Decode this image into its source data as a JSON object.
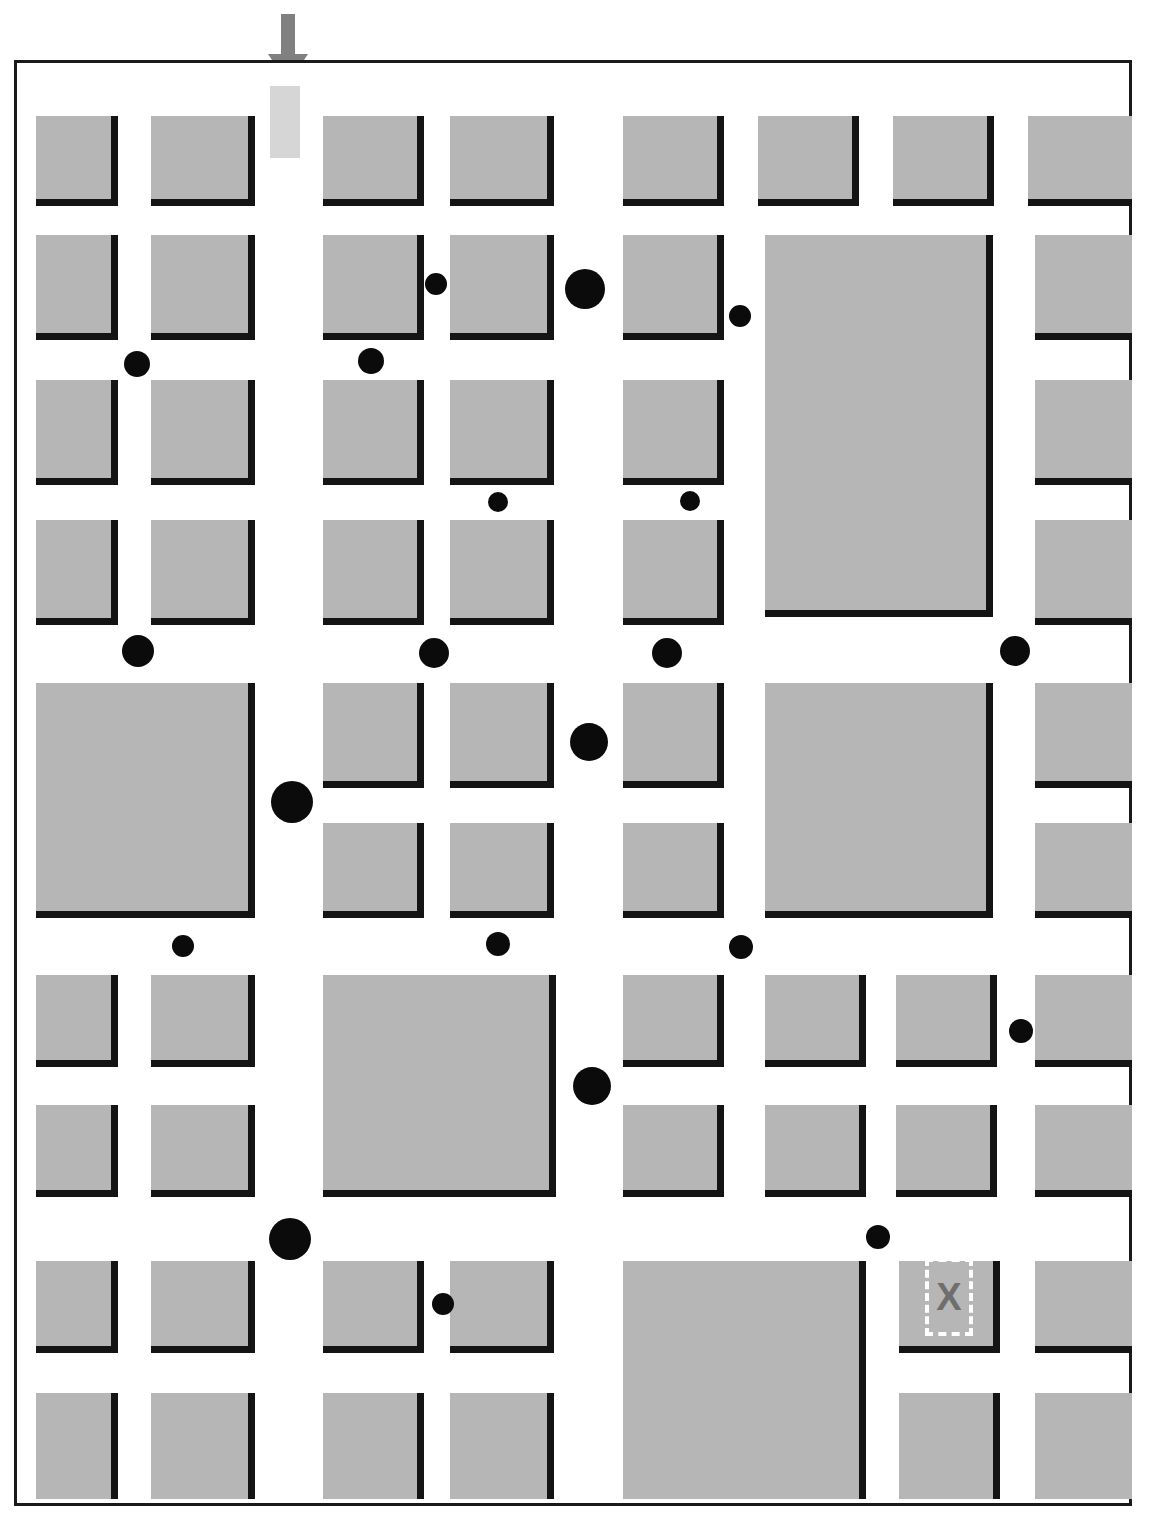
{
  "figure": {
    "type": "map-diagram",
    "kind": "urban-block-plan",
    "clipped_title": "",
    "frame": {
      "x": 14,
      "y": 60,
      "width": 1118,
      "height": 1446,
      "stroke": "#1a1a1a",
      "stroke_width": 3
    },
    "palette": {
      "background": "#ffffff",
      "block_fill": "#b6b6b6",
      "block_shadow": "#141414",
      "dot": "#0b0b0b",
      "arrow": "#808080",
      "arrow_highlight": "#d6d6d6",
      "dest_x": "#6e6e6e",
      "dest_outline": "#ffffff"
    }
  },
  "entry_arrow": {
    "label": "entry-arrow",
    "color": "#808080",
    "x": 266,
    "y": 14,
    "width": 44,
    "height": 72,
    "direction": "down"
  },
  "entry_highlight": {
    "label": "entry-corridor-highlight",
    "color": "#d6d6d6",
    "x": 270,
    "y": 86,
    "width": 30,
    "height": 72
  },
  "destination": {
    "label": "X",
    "marker_style": "dashed-white-rectangle",
    "x": 925,
    "y": 1258,
    "width": 48,
    "height": 78
  },
  "blocks": [
    {
      "x": 33,
      "y": 113,
      "w": 82,
      "h": 90,
      "clip": ""
    },
    {
      "x": 148,
      "y": 113,
      "w": 104,
      "h": 90,
      "clip": ""
    },
    {
      "x": 320,
      "y": 113,
      "w": 101,
      "h": 90,
      "clip": ""
    },
    {
      "x": 447,
      "y": 113,
      "w": 104,
      "h": 90,
      "clip": ""
    },
    {
      "x": 620,
      "y": 113,
      "w": 101,
      "h": 90,
      "clip": ""
    },
    {
      "x": 755,
      "y": 113,
      "w": 101,
      "h": 90,
      "clip": ""
    },
    {
      "x": 890,
      "y": 113,
      "w": 101,
      "h": 90,
      "clip": ""
    },
    {
      "x": 1025,
      "y": 113,
      "w": 104,
      "h": 90,
      "clip": "r"
    },
    {
      "x": 33,
      "y": 232,
      "w": 82,
      "h": 105,
      "clip": ""
    },
    {
      "x": 148,
      "y": 232,
      "w": 104,
      "h": 105,
      "clip": ""
    },
    {
      "x": 320,
      "y": 232,
      "w": 101,
      "h": 105,
      "clip": ""
    },
    {
      "x": 447,
      "y": 232,
      "w": 104,
      "h": 105,
      "clip": ""
    },
    {
      "x": 620,
      "y": 232,
      "w": 101,
      "h": 105,
      "clip": ""
    },
    {
      "x": 762,
      "y": 232,
      "w": 228,
      "h": 382,
      "clip": ""
    },
    {
      "x": 1032,
      "y": 232,
      "w": 97,
      "h": 105,
      "clip": "r"
    },
    {
      "x": 33,
      "y": 377,
      "w": 82,
      "h": 105,
      "clip": ""
    },
    {
      "x": 148,
      "y": 377,
      "w": 104,
      "h": 105,
      "clip": ""
    },
    {
      "x": 320,
      "y": 377,
      "w": 101,
      "h": 105,
      "clip": ""
    },
    {
      "x": 447,
      "y": 377,
      "w": 104,
      "h": 105,
      "clip": ""
    },
    {
      "x": 620,
      "y": 377,
      "w": 101,
      "h": 105,
      "clip": ""
    },
    {
      "x": 1032,
      "y": 377,
      "w": 97,
      "h": 105,
      "clip": "r"
    },
    {
      "x": 33,
      "y": 517,
      "w": 82,
      "h": 105,
      "clip": ""
    },
    {
      "x": 148,
      "y": 517,
      "w": 104,
      "h": 105,
      "clip": ""
    },
    {
      "x": 320,
      "y": 517,
      "w": 101,
      "h": 105,
      "clip": ""
    },
    {
      "x": 447,
      "y": 517,
      "w": 104,
      "h": 105,
      "clip": ""
    },
    {
      "x": 620,
      "y": 517,
      "w": 101,
      "h": 105,
      "clip": ""
    },
    {
      "x": 1032,
      "y": 517,
      "w": 97,
      "h": 105,
      "clip": "r"
    },
    {
      "x": 33,
      "y": 680,
      "w": 219,
      "h": 235,
      "clip": ""
    },
    {
      "x": 320,
      "y": 680,
      "w": 101,
      "h": 105,
      "clip": ""
    },
    {
      "x": 447,
      "y": 680,
      "w": 104,
      "h": 105,
      "clip": ""
    },
    {
      "x": 620,
      "y": 680,
      "w": 101,
      "h": 105,
      "clip": ""
    },
    {
      "x": 762,
      "y": 680,
      "w": 228,
      "h": 235,
      "clip": ""
    },
    {
      "x": 1032,
      "y": 680,
      "w": 97,
      "h": 105,
      "clip": "r"
    },
    {
      "x": 320,
      "y": 820,
      "w": 101,
      "h": 95,
      "clip": ""
    },
    {
      "x": 447,
      "y": 820,
      "w": 104,
      "h": 95,
      "clip": ""
    },
    {
      "x": 620,
      "y": 820,
      "w": 101,
      "h": 95,
      "clip": ""
    },
    {
      "x": 1032,
      "y": 820,
      "w": 97,
      "h": 95,
      "clip": "r"
    },
    {
      "x": 33,
      "y": 972,
      "w": 82,
      "h": 92,
      "clip": ""
    },
    {
      "x": 148,
      "y": 972,
      "w": 104,
      "h": 92,
      "clip": ""
    },
    {
      "x": 320,
      "y": 972,
      "w": 233,
      "h": 222,
      "clip": ""
    },
    {
      "x": 620,
      "y": 972,
      "w": 101,
      "h": 92,
      "clip": ""
    },
    {
      "x": 762,
      "y": 972,
      "w": 101,
      "h": 92,
      "clip": ""
    },
    {
      "x": 893,
      "y": 972,
      "w": 101,
      "h": 92,
      "clip": ""
    },
    {
      "x": 1032,
      "y": 972,
      "w": 97,
      "h": 92,
      "clip": "r"
    },
    {
      "x": 33,
      "y": 1102,
      "w": 82,
      "h": 92,
      "clip": ""
    },
    {
      "x": 148,
      "y": 1102,
      "w": 104,
      "h": 92,
      "clip": ""
    },
    {
      "x": 620,
      "y": 1102,
      "w": 101,
      "h": 92,
      "clip": ""
    },
    {
      "x": 762,
      "y": 1102,
      "w": 101,
      "h": 92,
      "clip": ""
    },
    {
      "x": 893,
      "y": 1102,
      "w": 101,
      "h": 92,
      "clip": ""
    },
    {
      "x": 1032,
      "y": 1102,
      "w": 97,
      "h": 92,
      "clip": "r"
    },
    {
      "x": 33,
      "y": 1258,
      "w": 82,
      "h": 92,
      "clip": ""
    },
    {
      "x": 148,
      "y": 1258,
      "w": 104,
      "h": 92,
      "clip": ""
    },
    {
      "x": 320,
      "y": 1258,
      "w": 101,
      "h": 92,
      "clip": ""
    },
    {
      "x": 447,
      "y": 1258,
      "w": 104,
      "h": 92,
      "clip": ""
    },
    {
      "x": 620,
      "y": 1258,
      "w": 243,
      "h": 238,
      "clip": "b"
    },
    {
      "x": 896,
      "y": 1258,
      "w": 101,
      "h": 92,
      "clip": ""
    },
    {
      "x": 1032,
      "y": 1258,
      "w": 97,
      "h": 92,
      "clip": "r"
    },
    {
      "x": 33,
      "y": 1390,
      "w": 82,
      "h": 106,
      "clip": "b"
    },
    {
      "x": 148,
      "y": 1390,
      "w": 104,
      "h": 106,
      "clip": "b"
    },
    {
      "x": 320,
      "y": 1390,
      "w": 101,
      "h": 106,
      "clip": "b"
    },
    {
      "x": 447,
      "y": 1390,
      "w": 104,
      "h": 106,
      "clip": "b"
    },
    {
      "x": 896,
      "y": 1390,
      "w": 101,
      "h": 106,
      "clip": "b"
    },
    {
      "x": 1032,
      "y": 1390,
      "w": 97,
      "h": 106,
      "clip": "rb"
    }
  ],
  "dots": [
    {
      "cx": 433,
      "cy": 281,
      "r": 11
    },
    {
      "cx": 582,
      "cy": 286,
      "r": 20
    },
    {
      "cx": 737,
      "cy": 313,
      "r": 11
    },
    {
      "cx": 134,
      "cy": 361,
      "r": 13
    },
    {
      "cx": 368,
      "cy": 358,
      "r": 13
    },
    {
      "cx": 495,
      "cy": 499,
      "r": 10
    },
    {
      "cx": 687,
      "cy": 498,
      "r": 10
    },
    {
      "cx": 135,
      "cy": 648,
      "r": 16
    },
    {
      "cx": 431,
      "cy": 650,
      "r": 15
    },
    {
      "cx": 664,
      "cy": 650,
      "r": 15
    },
    {
      "cx": 1012,
      "cy": 648,
      "r": 15
    },
    {
      "cx": 586,
      "cy": 739,
      "r": 19
    },
    {
      "cx": 289,
      "cy": 799,
      "r": 21
    },
    {
      "cx": 180,
      "cy": 943,
      "r": 11
    },
    {
      "cx": 495,
      "cy": 941,
      "r": 12
    },
    {
      "cx": 738,
      "cy": 944,
      "r": 12
    },
    {
      "cx": 1018,
      "cy": 1028,
      "r": 12
    },
    {
      "cx": 589,
      "cy": 1083,
      "r": 19
    },
    {
      "cx": 287,
      "cy": 1236,
      "r": 21
    },
    {
      "cx": 875,
      "cy": 1234,
      "r": 12
    },
    {
      "cx": 440,
      "cy": 1301,
      "r": 11
    }
  ]
}
